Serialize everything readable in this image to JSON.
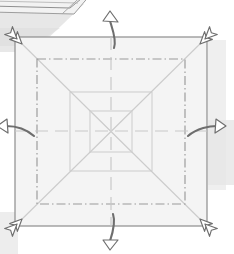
{
  "figure": {
    "kind": "origami-folding-diagram",
    "width": 234,
    "height": 254,
    "background_color": "#ffffff"
  },
  "colors": {
    "paper_fill": "#f4f4f4",
    "paper_edge": "#8d8d8d",
    "crease_mountain": "#9a9a9a",
    "crease_valley": "#c8c8c8",
    "crease_faint": "#d8d8d8",
    "arrow_stroke": "#6e6e6e",
    "arrow_fill": "#ffffff",
    "shadow": "#dcdcdc",
    "scrap_stroke": "#9a9a9a",
    "scrap_fill": "#f0f0f0"
  },
  "paper": {
    "name": "square-sheet",
    "left": 15,
    "top": 37,
    "right": 207,
    "bottom": 226,
    "fill": "#f4f4f4",
    "stroke": "#8d8d8d",
    "stroke_width": 1.2
  },
  "creases": [
    {
      "name": "crease-square-chain-outer",
      "style": "dash-dot",
      "inset": 22,
      "color": "#9a9a9a"
    },
    {
      "name": "crease-square-mid",
      "style": "solid",
      "inset": 55,
      "color": "#cfcfcf"
    },
    {
      "name": "crease-square-inner",
      "style": "solid",
      "inset": 75,
      "color": "#cfcfcf"
    },
    {
      "name": "crease-diagonal-nw-se",
      "style": "solid",
      "color": "#cccccc"
    },
    {
      "name": "crease-diagonal-ne-sw",
      "style": "solid",
      "color": "#cccccc"
    },
    {
      "name": "crease-axis-vertical",
      "style": "dashed",
      "color": "#c8c8c8"
    },
    {
      "name": "crease-axis-horizontal",
      "style": "dashed",
      "color": "#c8c8c8"
    }
  ],
  "arrows": {
    "corner_unfold": [
      {
        "name": "arrow-unfold-top-left",
        "direction": "up-left",
        "x": 15,
        "y": 37,
        "angle": 225
      },
      {
        "name": "arrow-unfold-top-right",
        "direction": "up-right",
        "x": 207,
        "y": 37,
        "angle": 315
      },
      {
        "name": "arrow-unfold-bottom-right",
        "direction": "down-right",
        "x": 207,
        "y": 226,
        "angle": 45
      },
      {
        "name": "arrow-unfold-bottom-left",
        "direction": "down-left",
        "x": 15,
        "y": 226,
        "angle": 135
      }
    ],
    "edge_fold": [
      {
        "name": "arrow-fold-top-center",
        "direction": "up",
        "x": 113,
        "y": 37
      },
      {
        "name": "arrow-fold-bottom-center",
        "direction": "down",
        "x": 113,
        "y": 226
      },
      {
        "name": "arrow-fold-left-center",
        "direction": "left",
        "x": 15,
        "y": 131
      },
      {
        "name": "arrow-fold-right-center",
        "direction": "right",
        "x": 207,
        "y": 131
      }
    ]
  },
  "scrap": {
    "name": "adjacent-figure-fragment",
    "description": "clipped sliver of the neighbouring diagram at the top-left",
    "stroke": "#9a9a9a"
  },
  "labels": {
    "none_visible": ""
  }
}
